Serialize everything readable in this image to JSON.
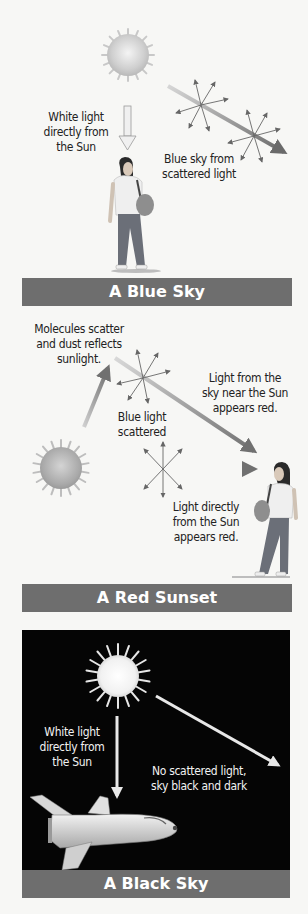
{
  "panels": [
    {
      "id": "blue-sky",
      "title": "A Blue Sky",
      "labels": {
        "direct_light": "White light\ndirectly from\nthe Sun",
        "scattered": "Blue sky from\nscattered light"
      }
    },
    {
      "id": "red-sunset",
      "title": "A Red Sunset",
      "labels": {
        "molecules": "Molecules scatter\nand dust reflects\nsunlight.",
        "sky_near_sun": "Light from the\nsky near the Sun\nappears red.",
        "blue_scattered": "Blue light\nscattered",
        "direct_red": "Light directly\nfrom the Sun\nappears red."
      }
    },
    {
      "id": "black-sky",
      "title": "A Black Sky",
      "labels": {
        "direct_light": "White light\ndirectly from\nthe Sun",
        "no_scatter": "No scattered light,\nsky black and dark"
      }
    }
  ],
  "colors": {
    "banner": "#6e6e6e",
    "background": "#f7f7f5",
    "space": "#050505",
    "arrow": "#777777"
  }
}
